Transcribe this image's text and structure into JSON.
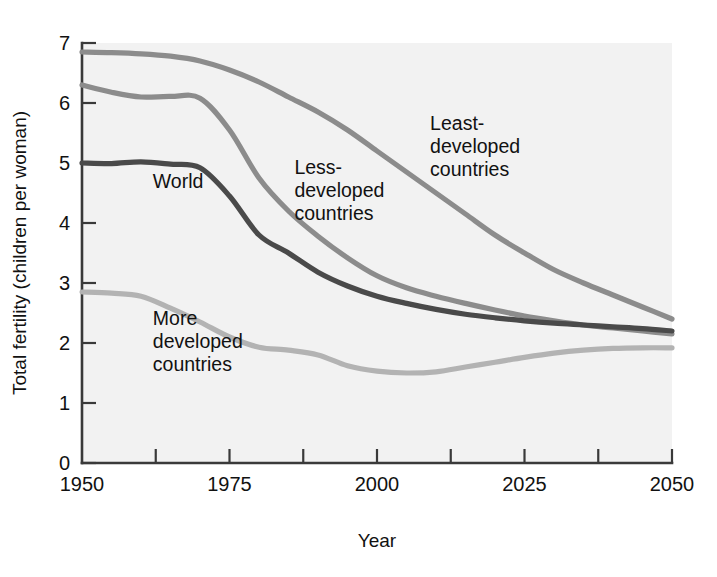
{
  "chart_data": {
    "type": "line",
    "title": "",
    "xlabel": "Year",
    "ylabel": "Total fertility (children per woman)",
    "xlim": [
      1950,
      2050
    ],
    "ylim": [
      0,
      7
    ],
    "xticks": [
      1950,
      1975,
      2000,
      2025,
      2050
    ],
    "xtick_labels": [
      "1950",
      "1975",
      "2000",
      "2025",
      "2050"
    ],
    "x_minor_tick_interval": 12.5,
    "yticks": [
      0,
      1,
      2,
      3,
      4,
      5,
      6,
      7
    ],
    "ytick_labels": [
      "0",
      "1",
      "2",
      "3",
      "4",
      "5",
      "6",
      "7"
    ],
    "grid": false,
    "legend": "inline-labels",
    "background": "#f2f2f2",
    "series": [
      {
        "name": "Least-developed countries",
        "color": "#8c8c8c",
        "label_text_lines": [
          "Least-",
          "developed",
          "countries"
        ],
        "label_x": 2009,
        "label_y": 5.55,
        "x": [
          1950,
          1955,
          1960,
          1965,
          1970,
          1975,
          1980,
          1985,
          1990,
          1995,
          2000,
          2005,
          2010,
          2015,
          2020,
          2025,
          2030,
          2035,
          2040,
          2045,
          2050
        ],
        "values": [
          6.85,
          6.84,
          6.82,
          6.78,
          6.7,
          6.55,
          6.35,
          6.1,
          5.85,
          5.55,
          5.2,
          4.85,
          4.5,
          4.15,
          3.8,
          3.5,
          3.22,
          3.0,
          2.8,
          2.6,
          2.4
        ]
      },
      {
        "name": "Less-developed countries",
        "color": "#8c8c8c",
        "label_text_lines": [
          "Less-",
          "developed",
          "countries"
        ],
        "label_x": 1986,
        "label_y": 4.82,
        "x": [
          1950,
          1955,
          1960,
          1965,
          1970,
          1975,
          1980,
          1985,
          1990,
          1995,
          2000,
          2005,
          2010,
          2015,
          2020,
          2025,
          2030,
          2035,
          2040,
          2045,
          2050
        ],
        "values": [
          6.3,
          6.18,
          6.1,
          6.11,
          6.08,
          5.55,
          4.75,
          4.2,
          3.78,
          3.42,
          3.12,
          2.92,
          2.78,
          2.66,
          2.55,
          2.45,
          2.37,
          2.3,
          2.25,
          2.2,
          2.15
        ]
      },
      {
        "name": "World",
        "color": "#4a4a4a",
        "label_text_lines": [
          "World"
        ],
        "label_x": 1962,
        "label_y": 4.58,
        "x": [
          1950,
          1955,
          1960,
          1965,
          1970,
          1975,
          1980,
          1985,
          1990,
          1995,
          2000,
          2005,
          2010,
          2015,
          2020,
          2025,
          2030,
          2035,
          2040,
          2045,
          2050
        ],
        "values": [
          5.0,
          4.99,
          5.02,
          4.98,
          4.92,
          4.45,
          3.8,
          3.5,
          3.18,
          2.95,
          2.78,
          2.66,
          2.56,
          2.48,
          2.42,
          2.37,
          2.33,
          2.3,
          2.27,
          2.24,
          2.2
        ]
      },
      {
        "name": "More developed countries",
        "color": "#b3b3b3",
        "label_text_lines": [
          "More",
          "developed",
          "countries"
        ],
        "label_x": 1962,
        "label_y": 2.3,
        "x": [
          1950,
          1955,
          1960,
          1965,
          1970,
          1975,
          1980,
          1985,
          1990,
          1995,
          2000,
          2005,
          2010,
          2015,
          2020,
          2025,
          2030,
          2035,
          2040,
          2045,
          2050
        ],
        "values": [
          2.85,
          2.83,
          2.78,
          2.58,
          2.35,
          2.1,
          1.93,
          1.88,
          1.8,
          1.62,
          1.53,
          1.5,
          1.52,
          1.6,
          1.68,
          1.76,
          1.83,
          1.88,
          1.91,
          1.92,
          1.92
        ]
      }
    ]
  },
  "axes": {
    "x_title": "Year",
    "y_title": "Total fertility (children per woman)"
  }
}
